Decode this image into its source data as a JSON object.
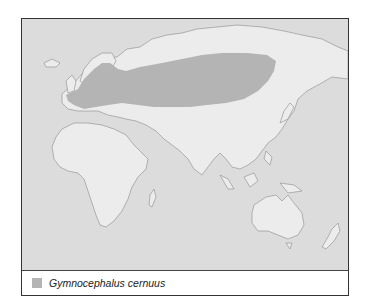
{
  "map": {
    "type": "species-distribution",
    "region": "Eurasia, Africa, Australia",
    "colors": {
      "ocean": "#dcdcdc",
      "land": "#ececec",
      "coastline": "#8a8a8a",
      "range": "#b4b4b4"
    }
  },
  "legend": {
    "items": [
      {
        "label": "Gymnocephalus cernuus",
        "color": "#b4b4b4"
      }
    ]
  }
}
